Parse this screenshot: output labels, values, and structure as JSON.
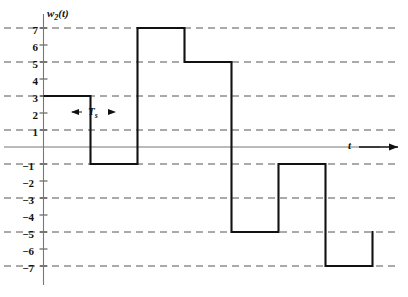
{
  "chart_data": {
    "type": "line",
    "title": "",
    "xlabel": "t",
    "ylabel": "w2(t)",
    "ylabel_base": "w",
    "ylabel_sub": "2",
    "ylabel_arg": "(t)",
    "annotation": "Ts",
    "annotation_base": "T",
    "annotation_sub": "s",
    "ytick_labels": [
      "7",
      "6",
      "5",
      "4",
      "3",
      "2",
      "1",
      "−1",
      "−2",
      "−3",
      "−4",
      "−5",
      "−6",
      "−7"
    ],
    "ytick_values": [
      7,
      6,
      5,
      4,
      3,
      2,
      1,
      -1,
      -2,
      -3,
      -4,
      -5,
      -6,
      -7
    ],
    "gridline_values": [
      7,
      5,
      3,
      1,
      -1,
      -3,
      -5,
      -7
    ],
    "grid": true,
    "grid_style": "dashed",
    "legend": "none",
    "ylim": [
      -8,
      8
    ],
    "xlim": [
      0,
      8
    ],
    "sample_period": 1,
    "categories": [
      "0",
      "1",
      "2",
      "3",
      "4",
      "5",
      "6",
      "7"
    ],
    "values": [
      3,
      -1,
      7,
      5,
      -5,
      -1,
      -7,
      -5
    ],
    "step_levels": [
      {
        "index": 0,
        "level": 3
      },
      {
        "index": 1,
        "level": -1
      },
      {
        "index": 2,
        "level": 7
      },
      {
        "index": 3,
        "level": 5
      },
      {
        "index": 4,
        "level": -5
      },
      {
        "index": 5,
        "level": -1
      },
      {
        "index": 6,
        "level": -7
      },
      {
        "index": 7,
        "level": -5
      }
    ],
    "waveform_color": "#000000",
    "grid_color": "#555555",
    "axis_color": "#666666"
  }
}
